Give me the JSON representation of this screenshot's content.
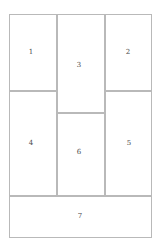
{
  "figure": {
    "type": "rectangle-partition-diagram",
    "canvas_width": 162,
    "canvas_height": 250,
    "background_color": "#ffffff",
    "line_color": "#b9b9b9",
    "label_color": "#4a4a4a",
    "frame": {
      "x": 9,
      "y": 14,
      "width": 143,
      "height": 224
    },
    "cells": [
      {
        "label": "1",
        "x": 9,
        "y": 14,
        "width": 48,
        "height": 77,
        "label_x": 31,
        "label_y": 52
      },
      {
        "label": "2",
        "x": 105,
        "y": 14,
        "width": 47,
        "height": 77,
        "label_x": 128,
        "label_y": 52
      },
      {
        "label": "3",
        "x": 57,
        "y": 14,
        "width": 48,
        "height": 99,
        "label_x": 79,
        "label_y": 65
      },
      {
        "label": "4",
        "x": 9,
        "y": 91,
        "width": 48,
        "height": 105,
        "label_x": 31,
        "label_y": 143
      },
      {
        "label": "5",
        "x": 105,
        "y": 91,
        "width": 47,
        "height": 105,
        "label_x": 129,
        "label_y": 143
      },
      {
        "label": "6",
        "x": 57,
        "y": 113,
        "width": 48,
        "height": 83,
        "label_x": 79,
        "label_y": 152
      },
      {
        "label": "7",
        "x": 9,
        "y": 196,
        "width": 143,
        "height": 42,
        "label_x": 80,
        "label_y": 216
      }
    ]
  }
}
